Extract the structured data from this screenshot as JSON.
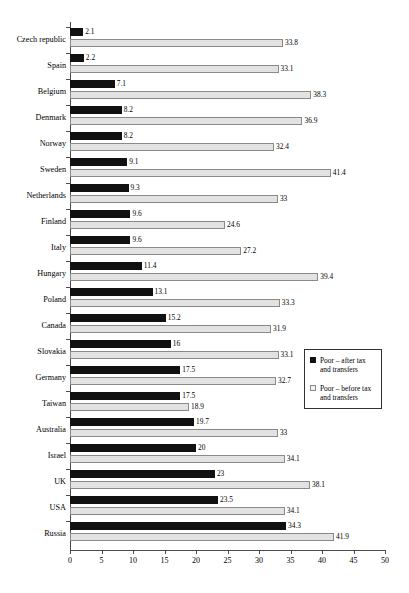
{
  "chart_data": {
    "type": "bar",
    "orientation": "horizontal",
    "title": "",
    "subtitle": "",
    "xlabel": "",
    "ylabel": "",
    "xlim": [
      0,
      50
    ],
    "xticks": [
      0,
      5,
      10,
      15,
      20,
      25,
      30,
      35,
      40,
      45,
      50
    ],
    "grid": false,
    "legend_position": "right-middle",
    "categories": [
      "Czech republic",
      "Spain",
      "Belgium",
      "Denmark",
      "Norway",
      "Sweden",
      "Netherlands",
      "Finland",
      "Italy",
      "Hungary",
      "Poland",
      "Canada",
      "Slovakia",
      "Germany",
      "Taiwan",
      "Australia",
      "Israel",
      "UK",
      "USA",
      "Russia"
    ],
    "series": [
      {
        "name": "Poor – after tax and transfers",
        "color": "#111111",
        "values": [
          2.1,
          2.2,
          7.1,
          8.2,
          8.2,
          9.1,
          9.3,
          9.6,
          9.6,
          11.4,
          13.1,
          15.2,
          16,
          17.5,
          17.5,
          19.7,
          20,
          23,
          23.5,
          34.3
        ],
        "labels": [
          "2.1",
          "2.2",
          "7.1",
          "8.2",
          "8.2",
          "9.1",
          "9.3",
          "9.6",
          "9.6",
          "11.4",
          "13.1",
          "15.2",
          "16",
          "17.5",
          "17.5",
          "19.7",
          "20",
          "23",
          "23.5",
          "34.3"
        ]
      },
      {
        "name": "Poor – before tax and transfers",
        "color": "#e2e2e2",
        "values": [
          33.8,
          33.1,
          38.3,
          36.9,
          32.4,
          41.4,
          33,
          24.6,
          27.2,
          39.4,
          33.3,
          31.9,
          33.1,
          32.7,
          18.9,
          33,
          34.1,
          38.1,
          34.1,
          41.9
        ],
        "labels": [
          "33.8",
          "33.1",
          "38.3",
          "36.9",
          "32.4",
          "41.4",
          "33",
          "24.6",
          "27.2",
          "39.4",
          "33.3",
          "31.9",
          "33.1",
          "32.7",
          "18.9",
          "33",
          "34.1",
          "38.1",
          "34.1",
          "41.9"
        ]
      }
    ]
  },
  "legend": {
    "entries": [
      {
        "label": "Poor – after tax and transfers",
        "swatch": "after"
      },
      {
        "label": "Poor – before tax and transfers",
        "swatch": "before"
      }
    ]
  }
}
